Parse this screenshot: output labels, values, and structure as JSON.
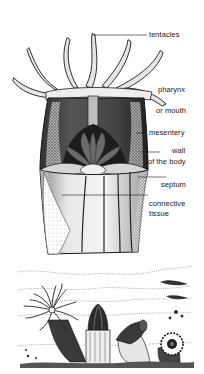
{
  "diagram": {
    "labels": {
      "tentacles": "tentacles",
      "pharynx_line1": "pharynx",
      "pharynx_line2": "or mouth",
      "mesentery": "mesentery",
      "wall_line1": "wall",
      "wall_line2": "of the body",
      "septum": "septum",
      "connective_line1": "connective",
      "connective_line2": "tissue"
    },
    "colors": {
      "ink": "#1a1a1a",
      "background": "#ffffff"
    }
  },
  "scene": {
    "subject": "sea anemones on the seabed"
  }
}
